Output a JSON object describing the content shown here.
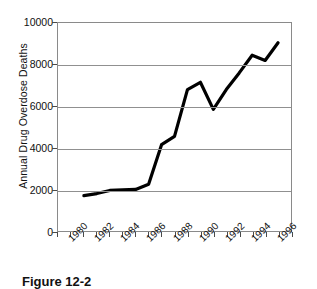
{
  "figure": {
    "caption": "Figure 12-2"
  },
  "chart_data": {
    "type": "line",
    "title": "",
    "xlabel": "",
    "ylabel": "Annual Drug Overdose Deaths",
    "xlim": [
      1979,
      1997
    ],
    "ylim": [
      0,
      10000
    ],
    "grid": true,
    "legend": "none",
    "y_ticks": [
      0,
      2000,
      4000,
      6000,
      8000,
      10000
    ],
    "y_tick_labels": [
      "0",
      "2000",
      "4000",
      "6000",
      "8000",
      "10000"
    ],
    "x_ticks": [
      1979,
      1980,
      1981,
      1982,
      1983,
      1984,
      1985,
      1986,
      1987,
      1988,
      1989,
      1990,
      1991,
      1992,
      1993,
      1994,
      1995,
      1996,
      1997
    ],
    "x_tick_labels": [
      "1980",
      "1982",
      "1984",
      "1986",
      "1988",
      "1990",
      "1992",
      "1994",
      "1996"
    ],
    "x_labeled_ticks": [
      1980,
      1982,
      1984,
      1986,
      1988,
      1990,
      1992,
      1994,
      1996
    ],
    "series": [
      {
        "name": "Annual Drug Overdose Deaths",
        "color": "#000000",
        "x": [
          1981,
          1982,
          1983,
          1984,
          1985,
          1986,
          1987,
          1988,
          1989,
          1990,
          1991,
          1992,
          1993,
          1994,
          1995,
          1996
        ],
        "values": [
          1700,
          1800,
          1950,
          1980,
          2000,
          2250,
          4150,
          4550,
          6800,
          7150,
          5850,
          6800,
          7600,
          8450,
          8200,
          9050
        ]
      }
    ]
  }
}
